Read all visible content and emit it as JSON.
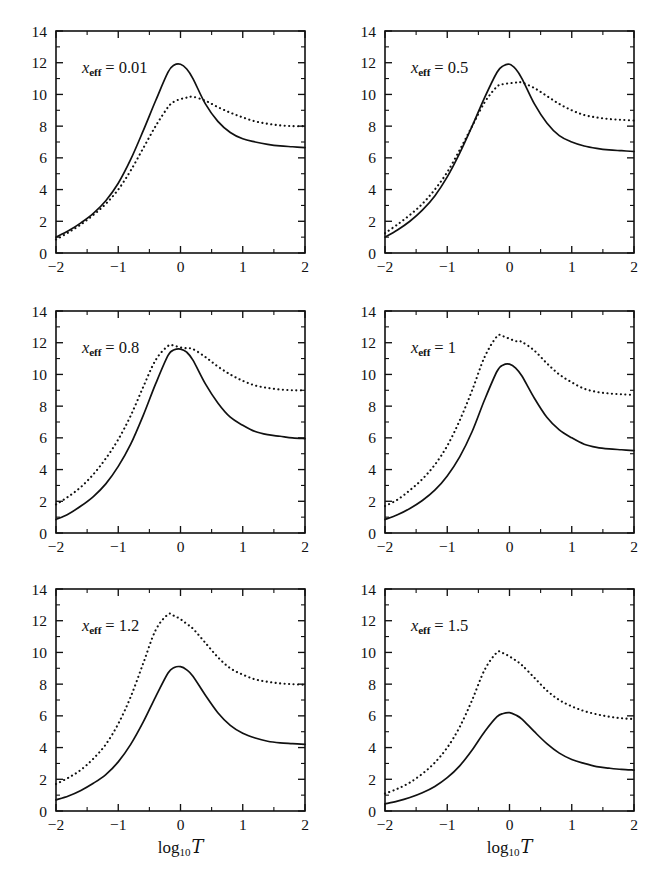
{
  "figure": {
    "background": "#ffffff",
    "ink_color": "#111111",
    "panel_columns": 2,
    "panel_rows": 3,
    "xaxis_title_plain": "log10 T",
    "xaxis_title_base": "log",
    "xaxis_title_sub": "10",
    "xaxis_title_symbol": "T",
    "caption_fragment": ""
  },
  "axes": {
    "xlim": [
      -2,
      2
    ],
    "ylim": [
      0,
      14
    ],
    "xticks": [
      -2,
      -1,
      0,
      1,
      2
    ],
    "xtick_labels": [
      "−2",
      "−1",
      "0",
      "1",
      "2"
    ],
    "xminor": [
      -1.5,
      -0.5,
      0.5,
      1.5
    ],
    "yticks": [
      0,
      2,
      4,
      6,
      8,
      10,
      12,
      14
    ],
    "ytick_labels": [
      "0",
      "2",
      "4",
      "6",
      "8",
      "10",
      "12",
      "14"
    ],
    "yminor": [
      1,
      3,
      5,
      7,
      9,
      11,
      13
    ],
    "grid": false,
    "tick_direction": "in",
    "frame": "box"
  },
  "legend": {
    "position": "none",
    "entries": [
      {
        "name": "solid-curve",
        "style": "solid"
      },
      {
        "name": "dotted-curve",
        "style": "dotted"
      }
    ]
  },
  "chart_data": [
    {
      "type": "line",
      "panel": "x_eff = 0.01",
      "label_var": "x",
      "label_sub": "eff",
      "label_value": "0.01",
      "title": "",
      "xlabel": "log10 T",
      "ylabel": "",
      "xlim": [
        -2,
        2
      ],
      "ylim": [
        0,
        14
      ],
      "x": [
        -2.0,
        -1.8,
        -1.6,
        -1.4,
        -1.2,
        -1.0,
        -0.8,
        -0.6,
        -0.4,
        -0.2,
        -0.1,
        0.0,
        0.1,
        0.2,
        0.4,
        0.6,
        0.8,
        1.0,
        1.2,
        1.4,
        1.6,
        1.8,
        2.0
      ],
      "series": [
        {
          "name": "solid-curve",
          "style": "solid",
          "values": [
            1.0,
            1.4,
            1.9,
            2.5,
            3.3,
            4.4,
            5.9,
            7.7,
            9.6,
            11.4,
            11.85,
            11.9,
            11.6,
            11.0,
            9.4,
            8.3,
            7.6,
            7.2,
            7.0,
            6.85,
            6.75,
            6.7,
            6.65
          ]
        },
        {
          "name": "dotted-curve",
          "style": "dotted",
          "values": [
            0.85,
            1.3,
            1.8,
            2.4,
            3.1,
            4.0,
            5.2,
            6.6,
            8.0,
            9.2,
            9.55,
            9.7,
            9.8,
            9.85,
            9.6,
            9.2,
            8.85,
            8.55,
            8.3,
            8.15,
            8.05,
            8.0,
            8.0
          ]
        }
      ]
    },
    {
      "type": "line",
      "panel": "x_eff = 0.5",
      "label_var": "x",
      "label_sub": "eff",
      "label_value": "0.5",
      "title": "",
      "xlabel": "log10 T",
      "ylabel": "",
      "xlim": [
        -2,
        2
      ],
      "ylim": [
        0,
        14
      ],
      "x": [
        -2.0,
        -1.8,
        -1.6,
        -1.4,
        -1.2,
        -1.0,
        -0.8,
        -0.6,
        -0.4,
        -0.2,
        -0.1,
        0.0,
        0.1,
        0.2,
        0.4,
        0.6,
        0.8,
        1.0,
        1.2,
        1.4,
        1.6,
        1.8,
        2.0
      ],
      "series": [
        {
          "name": "solid-curve",
          "style": "solid",
          "values": [
            1.0,
            1.45,
            2.0,
            2.7,
            3.6,
            4.8,
            6.3,
            8.0,
            9.8,
            11.4,
            11.8,
            11.9,
            11.6,
            11.0,
            9.4,
            8.2,
            7.4,
            7.0,
            6.75,
            6.6,
            6.5,
            6.45,
            6.4
          ]
        },
        {
          "name": "dotted-curve",
          "style": "dotted",
          "values": [
            1.25,
            1.8,
            2.4,
            3.1,
            4.0,
            5.1,
            6.5,
            8.0,
            9.5,
            10.5,
            10.65,
            10.7,
            10.75,
            10.75,
            10.4,
            9.9,
            9.4,
            9.0,
            8.7,
            8.55,
            8.45,
            8.4,
            8.35
          ]
        }
      ]
    },
    {
      "type": "line",
      "panel": "x_eff = 0.8",
      "label_var": "x",
      "label_sub": "eff",
      "label_value": "0.8",
      "title": "",
      "xlabel": "log10 T",
      "ylabel": "",
      "xlim": [
        -2,
        2
      ],
      "ylim": [
        0,
        14
      ],
      "x": [
        -2.0,
        -1.8,
        -1.6,
        -1.4,
        -1.2,
        -1.0,
        -0.8,
        -0.6,
        -0.4,
        -0.2,
        -0.1,
        0.0,
        0.1,
        0.2,
        0.4,
        0.6,
        0.8,
        1.0,
        1.2,
        1.4,
        1.6,
        1.8,
        2.0
      ],
      "series": [
        {
          "name": "solid-curve",
          "style": "solid",
          "values": [
            0.85,
            1.2,
            1.7,
            2.3,
            3.1,
            4.2,
            5.6,
            7.4,
            9.4,
            11.2,
            11.55,
            11.6,
            11.4,
            10.9,
            9.4,
            8.2,
            7.3,
            6.8,
            6.4,
            6.2,
            6.1,
            6.0,
            5.95
          ]
        },
        {
          "name": "dotted-curve",
          "style": "dotted",
          "values": [
            1.8,
            2.3,
            2.9,
            3.7,
            4.7,
            5.9,
            7.4,
            9.2,
            10.9,
            11.8,
            11.8,
            11.7,
            11.65,
            11.6,
            11.1,
            10.5,
            10.0,
            9.6,
            9.3,
            9.15,
            9.05,
            9.0,
            9.0
          ]
        }
      ]
    },
    {
      "type": "line",
      "panel": "x_eff = 1",
      "label_var": "x",
      "label_sub": "eff",
      "label_value": "1",
      "title": "",
      "xlabel": "log10 T",
      "ylabel": "",
      "xlim": [
        -2,
        2
      ],
      "ylim": [
        0,
        14
      ],
      "x": [
        -2.0,
        -1.8,
        -1.6,
        -1.4,
        -1.2,
        -1.0,
        -0.8,
        -0.6,
        -0.4,
        -0.2,
        -0.1,
        0.0,
        0.1,
        0.2,
        0.4,
        0.6,
        0.8,
        1.0,
        1.2,
        1.4,
        1.6,
        1.8,
        2.0
      ],
      "series": [
        {
          "name": "solid-curve",
          "style": "solid",
          "values": [
            0.85,
            1.15,
            1.55,
            2.05,
            2.7,
            3.6,
            4.8,
            6.4,
            8.4,
            10.2,
            10.6,
            10.65,
            10.4,
            9.9,
            8.5,
            7.3,
            6.5,
            6.0,
            5.6,
            5.4,
            5.3,
            5.25,
            5.2
          ]
        },
        {
          "name": "dotted-curve",
          "style": "dotted",
          "values": [
            1.7,
            2.1,
            2.7,
            3.4,
            4.3,
            5.5,
            7.1,
            9.0,
            11.1,
            12.4,
            12.4,
            12.25,
            12.1,
            12.05,
            11.5,
            10.7,
            10.0,
            9.5,
            9.1,
            8.9,
            8.8,
            8.75,
            8.7
          ]
        }
      ]
    },
    {
      "type": "line",
      "panel": "x_eff = 1.2",
      "label_var": "x",
      "label_sub": "eff",
      "label_value": "1.2",
      "title": "",
      "xlabel": "log10 T",
      "ylabel": "",
      "xlim": [
        -2,
        2
      ],
      "ylim": [
        0,
        14
      ],
      "x": [
        -2.0,
        -1.8,
        -1.6,
        -1.4,
        -1.2,
        -1.0,
        -0.8,
        -0.6,
        -0.4,
        -0.2,
        -0.1,
        0.0,
        0.1,
        0.2,
        0.4,
        0.6,
        0.8,
        1.0,
        1.2,
        1.4,
        1.6,
        1.8,
        2.0
      ],
      "series": [
        {
          "name": "solid-curve",
          "style": "solid",
          "values": [
            0.7,
            0.95,
            1.3,
            1.75,
            2.3,
            3.1,
            4.2,
            5.6,
            7.2,
            8.7,
            9.05,
            9.1,
            8.9,
            8.5,
            7.3,
            6.2,
            5.4,
            4.9,
            4.6,
            4.4,
            4.3,
            4.25,
            4.2
          ]
        },
        {
          "name": "dotted-curve",
          "style": "dotted",
          "values": [
            1.7,
            2.1,
            2.6,
            3.3,
            4.2,
            5.5,
            7.2,
            9.3,
            11.4,
            12.4,
            12.3,
            12.1,
            11.8,
            11.5,
            10.6,
            9.7,
            9.0,
            8.6,
            8.3,
            8.15,
            8.05,
            8.0,
            7.95
          ]
        }
      ]
    },
    {
      "type": "line",
      "panel": "x_eff = 1.5",
      "label_var": "x",
      "label_sub": "eff",
      "label_value": "1.5",
      "title": "",
      "xlabel": "log10 T",
      "ylabel": "",
      "xlim": [
        -2,
        2
      ],
      "ylim": [
        0,
        14
      ],
      "x": [
        -2.0,
        -1.8,
        -1.6,
        -1.4,
        -1.2,
        -1.0,
        -0.8,
        -0.6,
        -0.4,
        -0.2,
        -0.1,
        0.0,
        0.1,
        0.2,
        0.4,
        0.6,
        0.8,
        1.0,
        1.2,
        1.4,
        1.6,
        1.8,
        2.0
      ],
      "series": [
        {
          "name": "solid-curve",
          "style": "solid",
          "values": [
            0.45,
            0.62,
            0.85,
            1.15,
            1.55,
            2.1,
            2.85,
            3.85,
            5.0,
            5.95,
            6.15,
            6.2,
            6.05,
            5.8,
            5.0,
            4.25,
            3.65,
            3.25,
            3.0,
            2.8,
            2.7,
            2.62,
            2.58
          ]
        },
        {
          "name": "dotted-curve",
          "style": "dotted",
          "values": [
            1.1,
            1.4,
            1.8,
            2.35,
            3.05,
            4.0,
            5.3,
            7.0,
            8.9,
            10.0,
            9.95,
            9.75,
            9.5,
            9.2,
            8.4,
            7.6,
            7.0,
            6.6,
            6.3,
            6.1,
            5.95,
            5.85,
            5.8
          ]
        }
      ]
    }
  ]
}
